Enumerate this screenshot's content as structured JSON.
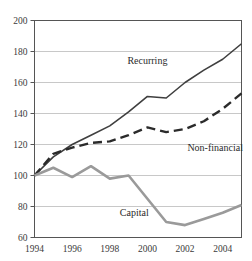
{
  "chart_data": {
    "type": "line",
    "title": "",
    "subtitle": "",
    "xlabel": "",
    "ylabel": "",
    "x": [
      1994,
      1995,
      1996,
      1997,
      1998,
      1999,
      2000,
      2001,
      2002,
      2003,
      2004,
      2005
    ],
    "xlim": [
      1994,
      2005
    ],
    "ylim": [
      60,
      200
    ],
    "xticks": [
      1994,
      1996,
      1998,
      2000,
      2002,
      2004
    ],
    "xtick_labels": [
      "1994",
      "1996",
      "1998",
      "2000",
      "2002",
      "2004"
    ],
    "yticks": [
      60,
      80,
      100,
      120,
      140,
      160,
      180,
      200
    ],
    "ytick_labels": [
      "60",
      "80",
      "100",
      "120",
      "140",
      "160",
      "180",
      "200"
    ],
    "grid": "horizontal",
    "legend": "inline-annotations",
    "series": [
      {
        "name": "Recurring",
        "style": "solid",
        "color": "#3f3f3f",
        "width": 1.6,
        "label_x": 2000.0,
        "label_y": 172,
        "values": [
          100,
          112,
          120,
          126,
          132,
          141,
          151,
          150,
          160,
          168,
          175,
          185
        ]
      },
      {
        "name": "Non-financial",
        "style": "dashed",
        "color": "#2b2b2b",
        "width": 2.4,
        "label_x": 2003.6,
        "label_y": 116,
        "values": [
          100,
          114,
          118,
          121,
          122,
          126,
          131,
          128,
          130,
          135,
          143,
          153
        ]
      },
      {
        "name": "Capital",
        "style": "solid",
        "color": "#9a9a9a",
        "width": 2.6,
        "label_x": 1999.3,
        "label_y": 74,
        "values": [
          100,
          105,
          99,
          106,
          98,
          100,
          85,
          70,
          68,
          72,
          76,
          81
        ]
      }
    ],
    "colors": {
      "frame": "#555555",
      "grid": "#c8c8c8",
      "text": "#3a3a3a",
      "background": "#ffffff"
    }
  }
}
